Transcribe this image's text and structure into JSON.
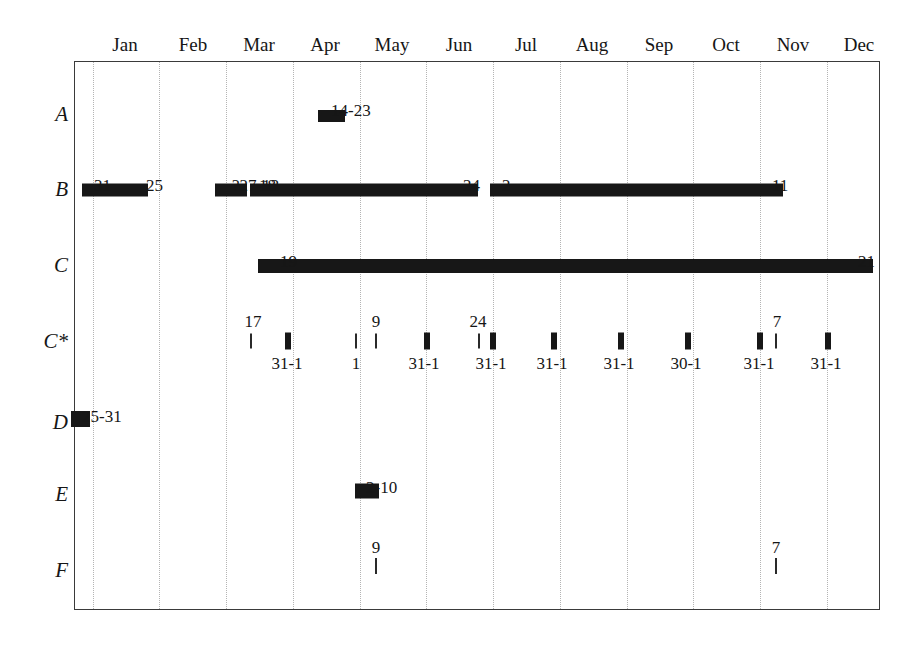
{
  "chart_data": {
    "type": "table",
    "title": "",
    "xlabel": "",
    "ylabel": "",
    "grid": true,
    "legend_position": "none",
    "x_axis": {
      "type": "months",
      "tick_labels": [
        "Jan",
        "Feb",
        "Mar",
        "Apr",
        "May",
        "Jun",
        "Jul",
        "Aug",
        "Sep",
        "Oct",
        "Nov",
        "Dec"
      ],
      "range": [
        "Jan",
        "Dec"
      ]
    },
    "y_axis": {
      "categories": [
        "A",
        "B",
        "C",
        "C*",
        "D",
        "E",
        "F"
      ]
    },
    "series": [
      {
        "name": "A",
        "intervals": [
          {
            "label": "14-23",
            "start_month": 4,
            "start_frac": 0.42,
            "end_month": 4,
            "end_frac": 0.74,
            "style": "bar"
          }
        ]
      },
      {
        "name": "B",
        "intervals": [
          {
            "label": "31",
            "label2": "25",
            "start_month": 1,
            "start_frac": 0.0,
            "end_month": 1,
            "end_frac": 1.0,
            "style": "bar"
          },
          {
            "label": "?27-13",
            "start_month": 2,
            "start_frac": 0.12,
            "end_month": 3,
            "end_frac": 0.02,
            "style": "bar"
          },
          {
            "label": "18",
            "label2": "24",
            "start_month": 3,
            "start_frac": 0.1,
            "end_month": 6,
            "end_frac": 0.97,
            "style": "bar"
          },
          {
            "label": "2",
            "label2": "11",
            "start_month": 7,
            "start_frac": 0.02,
            "end_month": 11,
            "end_frac": 0.28,
            "style": "bar"
          }
        ]
      },
      {
        "name": "C",
        "intervals": [
          {
            "label": "19",
            "label2": "21",
            "start_month": 3,
            "start_frac": 0.2,
            "end_month": 12,
            "end_frac": 0.72,
            "style": "bar"
          }
        ]
      },
      {
        "name": "C*",
        "ticks": [
          {
            "above": "17",
            "below": "",
            "month": 3,
            "frac": 0.02,
            "weight": "thin"
          },
          {
            "above": "",
            "below": "31",
            "month": 3,
            "frac": 0.72,
            "weight": "thick"
          },
          {
            "above": "",
            "below": "-1",
            "month": 3,
            "frac": 0.72,
            "weight": "none"
          },
          {
            "above": "9",
            "below": "1",
            "month": 4,
            "frac": 0.98,
            "weight": "thin"
          },
          {
            "above": "",
            "below": "",
            "month": 5,
            "frac": 0.12,
            "weight": "thin"
          },
          {
            "above": "",
            "below": "31-1",
            "month": 5,
            "frac": 0.96,
            "weight": "thick"
          },
          {
            "above": "24",
            "below": "",
            "month": 6,
            "frac": 0.9,
            "weight": "thin"
          },
          {
            "above": "",
            "below": "31-1",
            "month": 7,
            "frac": 0.02,
            "weight": "thick"
          },
          {
            "above": "",
            "below": "31-1",
            "month": 7,
            "frac": 0.98,
            "weight": "thick"
          },
          {
            "above": "",
            "below": "31-1",
            "month": 8,
            "frac": 0.98,
            "weight": "thick"
          },
          {
            "above": "",
            "below": "30-1",
            "month": 9,
            "frac": 0.98,
            "weight": "thick"
          },
          {
            "above": "7",
            "below": "31-1",
            "month": 10,
            "frac": 0.98,
            "weight": "thick"
          },
          {
            "above": "",
            "below": "31-1",
            "month": 11,
            "frac": 0.98,
            "weight": "thick"
          }
        ]
      },
      {
        "name": "D",
        "intervals": [
          {
            "label": "25-31",
            "start_month": 1,
            "start_frac": -0.22,
            "end_month": 1,
            "end_frac": -0.02,
            "style": "bar"
          }
        ]
      },
      {
        "name": "E",
        "intervals": [
          {
            "label": "2-10",
            "start_month": 5,
            "start_frac": 0.02,
            "end_month": 5,
            "end_frac": 0.3,
            "style": "bar"
          }
        ]
      },
      {
        "name": "F",
        "ticks": [
          {
            "above": "9",
            "below": "",
            "month": 5,
            "frac": 0.05,
            "weight": "thin"
          },
          {
            "above": "7",
            "below": "",
            "month": 10,
            "frac": 0.98,
            "weight": "thin"
          }
        ]
      }
    ]
  },
  "header": {
    "months": [
      {
        "label": "Jan",
        "x": 125
      },
      {
        "label": "Feb",
        "x": 193
      },
      {
        "label": "Mar",
        "x": 259
      },
      {
        "label": "Apr",
        "x": 325
      },
      {
        "label": "May",
        "x": 392
      },
      {
        "label": "Jun",
        "x": 459
      },
      {
        "label": "Jul",
        "x": 526
      },
      {
        "label": "Aug",
        "x": 592
      },
      {
        "label": "Sep",
        "x": 659
      },
      {
        "label": "Oct",
        "x": 726
      },
      {
        "label": "Nov",
        "x": 793
      },
      {
        "label": "Dec",
        "x": 859
      }
    ]
  },
  "rows": [
    {
      "label": "A",
      "y": 114
    },
    {
      "label": "B",
      "y": 189
    },
    {
      "label": "C",
      "y": 265
    },
    {
      "label": "C*",
      "y": 341
    },
    {
      "label": "D",
      "y": 422
    },
    {
      "label": "E",
      "y": 494
    },
    {
      "label": "F",
      "y": 570
    }
  ],
  "gridlines": [
    {
      "x": 92
    },
    {
      "x": 158
    },
    {
      "x": 225
    },
    {
      "x": 292
    },
    {
      "x": 359
    },
    {
      "x": 425
    },
    {
      "x": 492
    },
    {
      "x": 559
    },
    {
      "x": 626
    },
    {
      "x": 692
    },
    {
      "x": 759
    },
    {
      "x": 826
    }
  ],
  "bars": [
    {
      "name": "bar-a-1",
      "x": 318,
      "y": 116,
      "w": 27,
      "h": 12
    },
    {
      "name": "bar-b-1",
      "x": 82,
      "y": 190,
      "w": 66,
      "h": 13
    },
    {
      "name": "bar-b-2",
      "x": 215,
      "y": 190,
      "w": 32,
      "h": 13
    },
    {
      "name": "bar-b-3",
      "x": 250,
      "y": 190,
      "w": 228,
      "h": 13
    },
    {
      "name": "bar-b-4",
      "x": 490,
      "y": 190,
      "w": 293,
      "h": 13
    },
    {
      "name": "bar-c-1",
      "x": 258,
      "y": 266,
      "w": 615,
      "h": 14
    },
    {
      "name": "bar-d-1",
      "x": 71,
      "y": 419,
      "w": 19,
      "h": 16
    },
    {
      "name": "bar-e-1",
      "x": 355,
      "y": 491,
      "w": 24,
      "h": 15
    }
  ],
  "cstar_ticks": [
    {
      "x": 250,
      "weight": "thin"
    },
    {
      "x": 285,
      "weight": "thick"
    },
    {
      "x": 355,
      "weight": "thin"
    },
    {
      "x": 375,
      "weight": "thin"
    },
    {
      "x": 424,
      "weight": "thick"
    },
    {
      "x": 478,
      "weight": "thin"
    },
    {
      "x": 490,
      "weight": "thick"
    },
    {
      "x": 551,
      "weight": "thick"
    },
    {
      "x": 618,
      "weight": "thick"
    },
    {
      "x": 685,
      "weight": "thick"
    },
    {
      "x": 757,
      "weight": "thick"
    },
    {
      "x": 775,
      "weight": "thin"
    },
    {
      "x": 825,
      "weight": "thick"
    }
  ],
  "cstar_labels_above": [
    {
      "text": "17",
      "x": 253
    },
    {
      "text": "9",
      "x": 376
    },
    {
      "text": "24",
      "x": 478
    },
    {
      "text": "7",
      "x": 777
    }
  ],
  "cstar_labels_below": [
    {
      "text": "31-1",
      "x": 287
    },
    {
      "text": "1",
      "x": 356
    },
    {
      "text": "31-1",
      "x": 424
    },
    {
      "text": "31-1",
      "x": 491
    },
    {
      "text": "31-1",
      "x": 552
    },
    {
      "text": "31-1",
      "x": 619
    },
    {
      "text": "30-1",
      "x": 686
    },
    {
      "text": "31-1",
      "x": 759
    },
    {
      "text": "31-1",
      "x": 826
    }
  ],
  "f_ticks": [
    {
      "x": 375,
      "weight": "thin"
    },
    {
      "x": 775,
      "weight": "thin"
    }
  ],
  "f_labels_above": [
    {
      "text": "9",
      "x": 376
    },
    {
      "text": "7",
      "x": 776
    }
  ],
  "value_labels": [
    {
      "text": "14-23",
      "x": 331,
      "y": 102,
      "row": "A"
    },
    {
      "text": "31",
      "x": 94,
      "y": 177,
      "row": "B"
    },
    {
      "text": "25",
      "x": 146,
      "y": 177,
      "row": "B"
    },
    {
      "text": "?27-13",
      "x": 232,
      "y": 177,
      "row": "B"
    },
    {
      "text": "18",
      "x": 259,
      "y": 177,
      "row": "B"
    },
    {
      "text": "24",
      "x": 463,
      "y": 177,
      "row": "B"
    },
    {
      "text": "2",
      "x": 502,
      "y": 177,
      "row": "B"
    },
    {
      "text": "11",
      "x": 772,
      "y": 177,
      "row": "B"
    },
    {
      "text": "19",
      "x": 280,
      "y": 253,
      "row": "C"
    },
    {
      "text": "21",
      "x": 858,
      "y": 253,
      "row": "C"
    },
    {
      "text": "25-31",
      "x": 82,
      "y": 408,
      "row": "D"
    },
    {
      "text": "2-10",
      "x": 366,
      "y": 479,
      "row": "E"
    }
  ]
}
